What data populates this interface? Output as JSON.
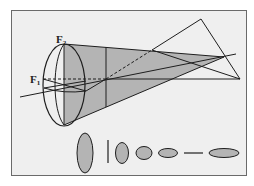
{
  "figure": {
    "labels": {
      "f1": {
        "main": "F",
        "sub": "1"
      },
      "f2": {
        "main": "F",
        "sub": "2"
      }
    },
    "colors": {
      "background": "#efefef",
      "frame": "#6a6a6a",
      "fill": "#b4b4b4",
      "stroke": "#1e1e1e"
    },
    "cross_sections": [
      {
        "shape": "vertical-ellipse"
      },
      {
        "shape": "vertical-line"
      },
      {
        "shape": "vertical-ellipse-small"
      },
      {
        "shape": "circle"
      },
      {
        "shape": "horizontal-ellipse"
      },
      {
        "shape": "horizontal-line"
      },
      {
        "shape": "horizontal-ellipse-large"
      }
    ]
  }
}
